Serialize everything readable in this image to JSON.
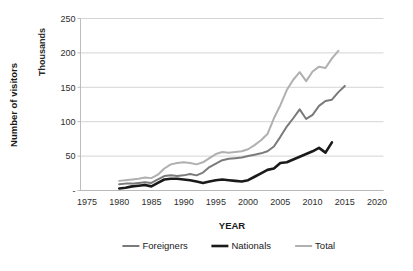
{
  "chart_data": {
    "type": "line",
    "title": "",
    "xlabel": "YEAR",
    "ylabel": "Number of visitors",
    "yunit": "Thousands",
    "xlim": [
      1974,
      2021
    ],
    "ylim": [
      0,
      250
    ],
    "xticks": [
      1975,
      1980,
      1985,
      1990,
      1995,
      2000,
      2005,
      2010,
      2015,
      2020
    ],
    "yticks": [
      "-",
      "50",
      "100",
      "150",
      "200",
      "250"
    ],
    "ytick_values": [
      0,
      50,
      100,
      150,
      200,
      250
    ],
    "grid": "horizontal",
    "legend_position": "bottom",
    "series": [
      {
        "name": "Foreigners",
        "color": "#7a7a7a",
        "width": 2.0,
        "x": [
          1980,
          1981,
          1982,
          1983,
          1984,
          1985,
          1986,
          1987,
          1988,
          1989,
          1990,
          1991,
          1992,
          1993,
          1994,
          1995,
          1996,
          1997,
          1998,
          1999,
          2000,
          2001,
          2002,
          2003,
          2004,
          2005,
          2006,
          2007,
          2008,
          2009,
          2010,
          2011,
          2012,
          2013,
          2014,
          2015
        ],
        "values": [
          9,
          10,
          10,
          11,
          12,
          11,
          16,
          21,
          22,
          21,
          22,
          24,
          22,
          26,
          34,
          39,
          44,
          46,
          47,
          48,
          50,
          52,
          54,
          57,
          64,
          78,
          93,
          105,
          118,
          104,
          110,
          123,
          130,
          132,
          143,
          152
        ]
      },
      {
        "name": "Nationals",
        "color": "#1a1a1a",
        "width": 2.6,
        "x": [
          1980,
          1981,
          1982,
          1983,
          1984,
          1985,
          1986,
          1987,
          1988,
          1989,
          1990,
          1991,
          1992,
          1993,
          1994,
          1995,
          1996,
          1997,
          1998,
          1999,
          2000,
          2001,
          2002,
          2003,
          2004,
          2005,
          2006,
          2007,
          2008,
          2009,
          2010,
          2011,
          2012,
          2013
        ],
        "values": [
          3,
          4,
          6,
          7,
          8,
          6,
          11,
          16,
          17,
          17,
          16,
          15,
          13,
          11,
          13,
          15,
          16,
          15,
          14,
          13,
          15,
          20,
          25,
          30,
          32,
          40,
          41,
          45,
          49,
          53,
          57,
          62,
          55,
          70
        ]
      },
      {
        "name": "Total",
        "color": "#b0b0b0",
        "width": 2.0,
        "x": [
          1980,
          1981,
          1982,
          1983,
          1984,
          1985,
          1986,
          1987,
          1988,
          1989,
          1990,
          1991,
          1992,
          1993,
          1994,
          1995,
          1996,
          1997,
          1998,
          1999,
          2000,
          2001,
          2002,
          2003,
          2004,
          2005,
          2006,
          2007,
          2008,
          2009,
          2010,
          2011,
          2012,
          2013,
          2014
        ],
        "values": [
          14,
          15,
          16,
          17,
          19,
          18,
          23,
          32,
          38,
          40,
          41,
          40,
          38,
          41,
          47,
          53,
          56,
          55,
          56,
          57,
          60,
          66,
          73,
          82,
          105,
          124,
          146,
          161,
          172,
          159,
          173,
          180,
          178,
          192,
          203
        ]
      }
    ]
  },
  "axis": {
    "y_title": "Number of visitors",
    "y_unit": "Thousands",
    "x_title": "YEAR"
  },
  "legend": {
    "items": [
      {
        "label": "Foreigners"
      },
      {
        "label": "Nationals"
      },
      {
        "label": "Total"
      }
    ]
  }
}
